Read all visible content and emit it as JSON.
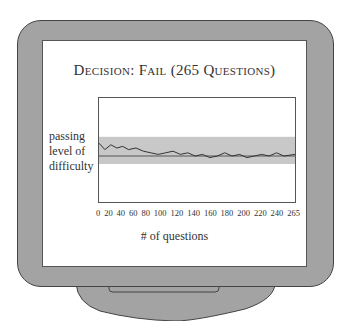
{
  "title": "Decision: Fail (265 Questions)",
  "y_axis_label_lines": [
    "passing",
    "level of",
    "difficulty"
  ],
  "x_axis_label": "# of questions",
  "x_ticks": [
    "0",
    "20",
    "40",
    "60",
    "80",
    "100",
    "120",
    "140",
    "160",
    "180",
    "200",
    "220",
    "240",
    "265"
  ],
  "colors": {
    "frame": "#a3a3a3",
    "band": "#c8c8c8",
    "line": "#333333",
    "passing_line": "#555555"
  },
  "chart_data": {
    "type": "line",
    "title": "Decision: Fail (265 Questions)",
    "xlabel": "# of questions",
    "ylabel": "passing level of difficulty",
    "xlim": [
      0,
      265
    ],
    "x_ticks": [
      0,
      20,
      40,
      60,
      80,
      100,
      120,
      140,
      160,
      180,
      200,
      220,
      240,
      265
    ],
    "passing_level": 0,
    "confidence_band": [
      -5,
      12
    ],
    "series": [
      {
        "name": "estimated ability",
        "x": [
          0,
          8,
          16,
          24,
          32,
          40,
          50,
          60,
          70,
          80,
          90,
          100,
          110,
          120,
          130,
          140,
          150,
          160,
          170,
          180,
          190,
          200,
          210,
          220,
          230,
          240,
          250,
          265
        ],
        "y": [
          8,
          4,
          7,
          5,
          6,
          4,
          5,
          3,
          2,
          1,
          2,
          3,
          1,
          2,
          0,
          1,
          -1,
          0,
          2,
          0,
          1,
          -1,
          0,
          1,
          0,
          2,
          0,
          1
        ]
      }
    ]
  }
}
